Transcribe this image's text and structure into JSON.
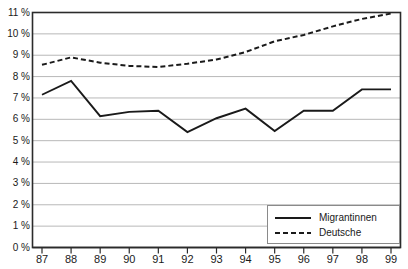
{
  "chart_data": {
    "type": "line",
    "title": "",
    "xlabel": "",
    "ylabel": "",
    "x": [
      "87",
      "88",
      "89",
      "90",
      "91",
      "92",
      "93",
      "94",
      "95",
      "96",
      "97",
      "98",
      "99"
    ],
    "categories": [
      "87",
      "88",
      "89",
      "90",
      "91",
      "92",
      "93",
      "94",
      "95",
      "96",
      "97",
      "98",
      "99"
    ],
    "ylim": [
      0,
      11
    ],
    "ytick_labels": [
      "11 %",
      "10 %",
      "9 %",
      "8 %",
      "7 %",
      "6 %",
      "5 %",
      "4 %",
      "3 %",
      "2 %",
      "1 %",
      "0 %"
    ],
    "ytick_values": [
      11,
      10,
      9,
      8,
      7,
      6,
      5,
      4,
      3,
      2,
      1,
      0
    ],
    "grid": true,
    "grid_axis": "y",
    "legend_position": "bottom-right",
    "series": [
      {
        "name": "Migrantinnen",
        "style": "solid",
        "color": "#1a1a1a",
        "values": [
          7.15,
          7.8,
          6.15,
          6.35,
          6.4,
          5.4,
          6.05,
          6.5,
          5.45,
          6.4,
          6.4,
          7.4,
          7.4
        ]
      },
      {
        "name": "Deutsche",
        "style": "dashed",
        "color": "#1a1a1a",
        "values": [
          8.55,
          8.9,
          8.65,
          8.5,
          8.45,
          8.6,
          8.8,
          9.15,
          9.65,
          9.95,
          10.35,
          10.7,
          10.95
        ]
      }
    ]
  },
  "legend": {
    "items": [
      {
        "label": "Migrantinnen",
        "style": "solid"
      },
      {
        "label": "Deutsche",
        "style": "dashed"
      }
    ]
  },
  "title_sliver": {
    "text": ""
  },
  "colors": {
    "axis": "#2b2b2b",
    "grid": "#b8b8b8",
    "line": "#1a1a1a",
    "text": "#1a1a1a",
    "background": "#ffffff"
  }
}
